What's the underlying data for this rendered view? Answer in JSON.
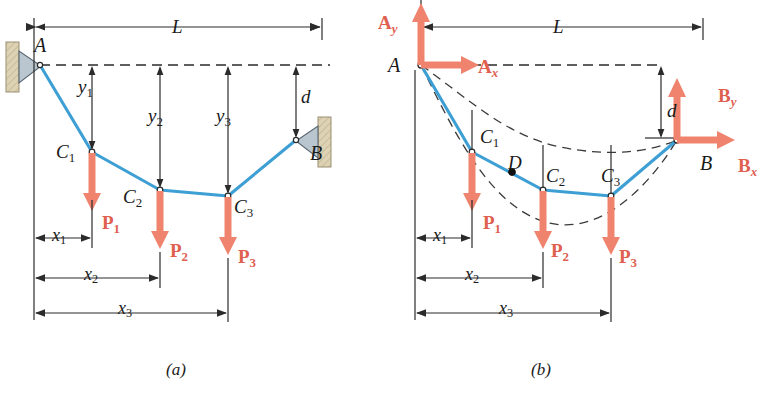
{
  "figure": {
    "captions": [
      {
        "name": "caption-a",
        "text": "(a)",
        "x": 166,
        "y": 360
      },
      {
        "name": "caption-b",
        "text": "(b)",
        "x": 531,
        "y": 360
      }
    ],
    "colors": {
      "cable": "#3d9fd4",
      "force_arrow": "#f0836e",
      "force_label": "#e06050",
      "wall_fill": "#ddd2b4",
      "wall_edge": "#9a8f73",
      "support_fill": "#b9c6d0",
      "dim_line": "#2b2b2b",
      "dashed": "#3a3a3a",
      "text": "#1a1a1a"
    }
  },
  "panel_a": {
    "name": "free-body-cable-diagram-a",
    "dimension_labels": [
      {
        "name": "span-label-L",
        "base": "L",
        "sub": "",
        "x": 172,
        "y": 16,
        "size": 19
      },
      {
        "name": "sag-label-y1",
        "base": "y",
        "sub": "1",
        "x": 78,
        "y": 76,
        "size": 19
      },
      {
        "name": "sag-label-y2",
        "base": "y",
        "sub": "2",
        "x": 148,
        "y": 105,
        "size": 19
      },
      {
        "name": "sag-label-y3",
        "base": "y",
        "sub": "3",
        "x": 216,
        "y": 105,
        "size": 19
      },
      {
        "name": "drop-label-d",
        "base": "d",
        "sub": "",
        "x": 301,
        "y": 86,
        "size": 19
      },
      {
        "name": "dist-label-x1",
        "base": "x",
        "sub": "1",
        "x": 52,
        "y": 225,
        "size": 18
      },
      {
        "name": "dist-label-x2",
        "base": "x",
        "sub": "2",
        "x": 84,
        "y": 264,
        "size": 18
      },
      {
        "name": "dist-label-x3",
        "base": "x",
        "sub": "3",
        "x": 118,
        "y": 298,
        "size": 18
      }
    ],
    "point_labels": [
      {
        "name": "point-label-A",
        "base": "A",
        "sub": "",
        "x": 34,
        "y": 34,
        "size": 20
      },
      {
        "name": "point-label-C1",
        "base": "C",
        "sub": "1",
        "x": 56,
        "y": 141,
        "size": 19
      },
      {
        "name": "point-label-C2",
        "base": "C",
        "sub": "2",
        "x": 123,
        "y": 186,
        "size": 19
      },
      {
        "name": "point-label-C3",
        "base": "C",
        "sub": "3",
        "x": 234,
        "y": 196,
        "size": 19
      },
      {
        "name": "point-label-B",
        "base": "B",
        "sub": "",
        "x": 310,
        "y": 142,
        "size": 20
      }
    ],
    "force_labels": [
      {
        "name": "force-label-P1",
        "base": "P",
        "sub": "1",
        "x": 102,
        "y": 212,
        "size": 19
      },
      {
        "name": "force-label-P2",
        "base": "P",
        "sub": "2",
        "x": 170,
        "y": 240,
        "size": 19
      },
      {
        "name": "force-label-P3",
        "base": "P",
        "sub": "3",
        "x": 238,
        "y": 246,
        "size": 19
      }
    ]
  },
  "panel_b": {
    "name": "free-body-cable-diagram-b",
    "dimension_labels": [
      {
        "name": "span-label-L",
        "base": "L",
        "sub": "",
        "x": 553,
        "y": 16,
        "size": 19
      },
      {
        "name": "drop-label-d",
        "base": "d",
        "sub": "",
        "x": 667,
        "y": 100,
        "size": 19
      },
      {
        "name": "dist-label-x1",
        "base": "x",
        "sub": "1",
        "x": 433,
        "y": 225,
        "size": 18
      },
      {
        "name": "dist-label-x2",
        "base": "x",
        "sub": "2",
        "x": 465,
        "y": 264,
        "size": 18
      },
      {
        "name": "dist-label-x3",
        "base": "x",
        "sub": "3",
        "x": 499,
        "y": 298,
        "size": 18
      }
    ],
    "point_labels": [
      {
        "name": "point-label-A",
        "base": "A",
        "sub": "",
        "x": 388,
        "y": 54,
        "size": 20
      },
      {
        "name": "point-label-C1",
        "base": "C",
        "sub": "1",
        "x": 480,
        "y": 126,
        "size": 19
      },
      {
        "name": "point-label-D",
        "base": "D",
        "sub": "",
        "x": 508,
        "y": 152,
        "size": 19
      },
      {
        "name": "point-label-C2",
        "base": "C",
        "sub": "2",
        "x": 546,
        "y": 165,
        "size": 19
      },
      {
        "name": "point-label-C3",
        "base": "C",
        "sub": "3",
        "x": 601,
        "y": 165,
        "size": 19
      },
      {
        "name": "point-label-B",
        "base": "B",
        "sub": "",
        "x": 700,
        "y": 152,
        "size": 20
      }
    ],
    "force_labels": [
      {
        "name": "reaction-label-Ay",
        "base": "A",
        "sub": "y",
        "x": 378,
        "y": 12,
        "size": 19
      },
      {
        "name": "reaction-label-Ax",
        "base": "A",
        "sub": "x",
        "x": 478,
        "y": 56,
        "size": 19
      },
      {
        "name": "reaction-label-By",
        "base": "B",
        "sub": "y",
        "x": 718,
        "y": 85,
        "size": 19
      },
      {
        "name": "reaction-label-Bx",
        "base": "B",
        "sub": "x",
        "x": 738,
        "y": 155,
        "size": 19
      },
      {
        "name": "force-label-P1",
        "base": "P",
        "sub": "1",
        "x": 483,
        "y": 212,
        "size": 19
      },
      {
        "name": "force-label-P2",
        "base": "P",
        "sub": "2",
        "x": 551,
        "y": 240,
        "size": 19
      },
      {
        "name": "force-label-P3",
        "base": "P",
        "sub": "3",
        "x": 619,
        "y": 246,
        "size": 19
      }
    ]
  },
  "geometry": {
    "panel_a": {
      "left_ref_x": 34,
      "right_ref_x": 322,
      "datum_y": 65,
      "nodes": {
        "A": [
          40,
          65
        ],
        "C1": [
          92,
          152
        ],
        "C2": [
          160,
          190
        ],
        "C3": [
          228,
          196
        ],
        "B": [
          296,
          140
        ]
      },
      "dim_L_y": 27,
      "dim_x1_y": 238,
      "dim_x2_y": 278,
      "dim_x3_y": 313
    },
    "panel_b": {
      "left_ref_x": 415,
      "right_ref_x": 703,
      "datum_y": 65,
      "nodes": {
        "A": [
          421,
          65
        ],
        "C1": [
          472,
          152
        ],
        "D": [
          512,
          172
        ],
        "C2": [
          543,
          190
        ],
        "C3": [
          611,
          196
        ],
        "B": [
          677,
          140
        ]
      },
      "dim_L_y": 27,
      "dim_x1_y": 238,
      "dim_x2_y": 278,
      "dim_x3_y": 313
    }
  }
}
